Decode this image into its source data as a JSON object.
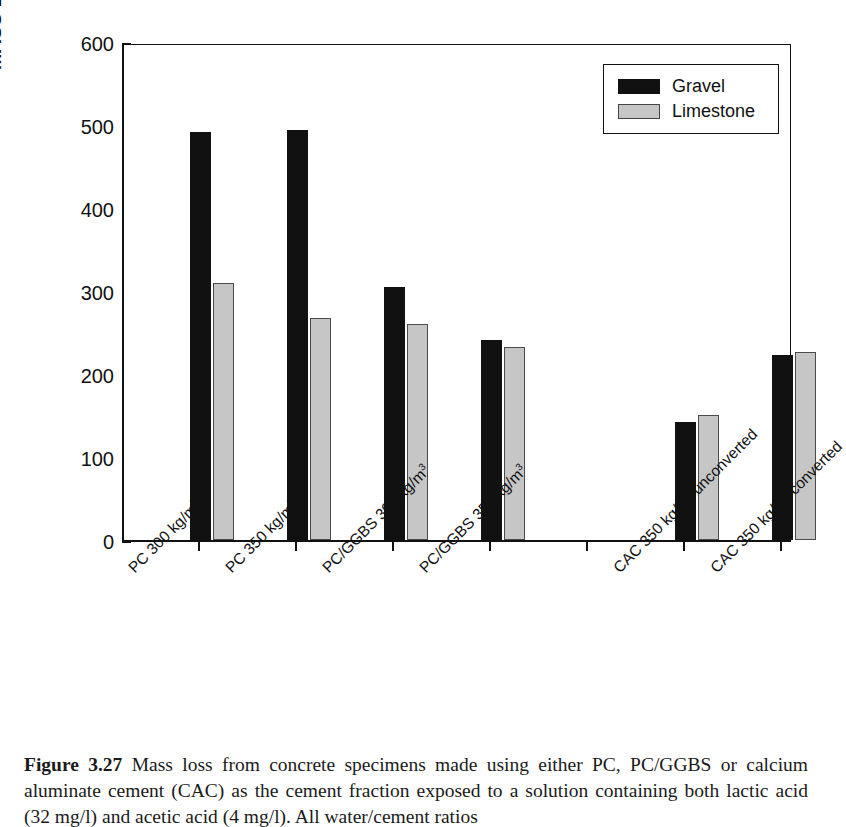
{
  "figure": {
    "caption_label": "Figure 3.27",
    "caption_text": " Mass loss from concrete specimens made using either PC, PC/GGBS or calcium aluminate cement (CAC) as the cement fraction exposed to a solution containing both lactic acid (32 mg/l) and acetic acid (4 mg/l). All water/cement ratios"
  },
  "legend": {
    "position": "top-right",
    "entries": [
      {
        "label": "Gravel",
        "color": "#111111"
      },
      {
        "label": "Limestone",
        "color": "#c6c6c6"
      }
    ]
  },
  "axis": {
    "y_title_main": "MASS LOSS PER UNIT AREA, mg/cm",
    "y_title_sup": "2",
    "y_ticks": [
      "0",
      "100",
      "200",
      "300",
      "400",
      "500",
      "600"
    ]
  },
  "chart_data": {
    "type": "bar",
    "title": "",
    "xlabel": "",
    "ylabel": "MASS LOSS PER UNIT AREA, mg/cm2",
    "ylim": [
      0,
      600
    ],
    "ytick_values": [
      0,
      100,
      200,
      300,
      400,
      500,
      600
    ],
    "grid": false,
    "legend_position": "upper right",
    "categories": [
      "PC 300 kg/m3",
      "PC 350 kg/m3",
      "PC/GGBS 300 kg/m3",
      "PC/GGBS 350 kg/m3",
      "",
      "CAC 350 kg/m3 unconverted",
      "CAC 350 kg/m3 converted"
    ],
    "category_labels": [
      {
        "main": "PC 300 kg/m",
        "sup": "3"
      },
      {
        "main": "PC 350 kg/m",
        "sup": "3"
      },
      {
        "main": "PC/GGBS 300 kg/m",
        "sup": "3"
      },
      {
        "main": "PC/GGBS 350 kg/m",
        "sup": "3"
      },
      {
        "main": "",
        "sup": ""
      },
      {
        "main": "CAC 350 kg/m",
        "sup": "3",
        "tail": " unconverted"
      },
      {
        "main": "CAC 350 kg/m",
        "sup": "3",
        "tail": " converted"
      }
    ],
    "series": [
      {
        "name": "Gravel",
        "color": "#111111",
        "values": [
          492,
          494,
          305,
          241,
          null,
          142,
          223
        ]
      },
      {
        "name": "Limestone",
        "color": "#c6c6c6",
        "values": [
          310,
          268,
          260,
          232,
          null,
          151,
          227
        ]
      }
    ]
  }
}
